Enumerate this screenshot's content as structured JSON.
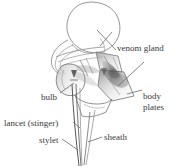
{
  "figure": {
    "background_color": "#ffffff",
    "ink_color": "#3a3a3a",
    "outline_color": "#808080",
    "shade_color": "#6e6e6e"
  },
  "labels": {
    "venom_gland": "venom gland",
    "bulb": "bulb",
    "body_line1": "body",
    "body_line2": "plates",
    "lancet": "lancet (stinger)",
    "stylet": "stylet",
    "sheath": "sheath"
  },
  "parts": [
    {
      "name": "venom-gland",
      "label": "venom gland"
    },
    {
      "name": "bulb",
      "label": "bulb"
    },
    {
      "name": "body-plates",
      "label": "body plates"
    },
    {
      "name": "lancet",
      "label": "lancet (stinger)"
    },
    {
      "name": "stylet",
      "label": "stylet"
    },
    {
      "name": "sheath",
      "label": "sheath"
    }
  ]
}
